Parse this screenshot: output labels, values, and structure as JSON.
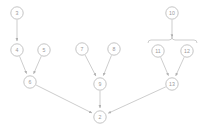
{
  "diagram": {
    "type": "directed-graph",
    "title": "",
    "node_radius": 6.2,
    "colors": {
      "node_stroke": "#bdbdbd",
      "node_fill": "#ffffff",
      "label_text": "#9a9a9a",
      "edge": "#c0c0c0",
      "brace": "#c4c4c4",
      "background": "#ffffff"
    },
    "nodes": [
      {
        "id": "n3",
        "label": "3",
        "x": 17,
        "y": 13
      },
      {
        "id": "n4",
        "label": "4",
        "x": 17,
        "y": 50
      },
      {
        "id": "n5",
        "label": "5",
        "x": 44,
        "y": 50
      },
      {
        "id": "n6",
        "label": "6",
        "x": 30,
        "y": 82
      },
      {
        "id": "n7",
        "label": "7",
        "x": 82,
        "y": 49
      },
      {
        "id": "n8",
        "label": "8",
        "x": 114,
        "y": 49
      },
      {
        "id": "n9",
        "label": "9",
        "x": 100,
        "y": 84
      },
      {
        "id": "n10",
        "label": "10",
        "x": 172,
        "y": 13
      },
      {
        "id": "n11",
        "label": "11",
        "x": 158,
        "y": 51
      },
      {
        "id": "n12",
        "label": "12",
        "x": 187,
        "y": 51
      },
      {
        "id": "n13",
        "label": "13",
        "x": 172,
        "y": 84
      },
      {
        "id": "n2",
        "label": "2",
        "x": 100,
        "y": 117
      }
    ],
    "edges": [
      {
        "id": "e1",
        "from": "n3",
        "to": "n4",
        "arrow": true
      },
      {
        "id": "e2",
        "from": "n4",
        "to": "n6",
        "arrow": true
      },
      {
        "id": "e3",
        "from": "n5",
        "to": "n6",
        "arrow": true
      },
      {
        "id": "e4",
        "from": "n7",
        "to": "n9",
        "arrow": true
      },
      {
        "id": "e5",
        "from": "n8",
        "to": "n9",
        "arrow": true
      },
      {
        "id": "e6",
        "from": "n10",
        "to": "brace",
        "arrow": true
      },
      {
        "id": "e7",
        "from": "n11",
        "to": "n13",
        "arrow": true
      },
      {
        "id": "e8",
        "from": "n12",
        "to": "n13",
        "arrow": true
      },
      {
        "id": "e9",
        "from": "n6",
        "to": "n2",
        "arrow": true
      },
      {
        "id": "e10",
        "from": "n9",
        "to": "n2",
        "arrow": true
      },
      {
        "id": "e11",
        "from": "n13",
        "to": "n2",
        "arrow": true
      }
    ],
    "brace": {
      "id": "group-brace",
      "label": "",
      "left_x": 148,
      "right_x": 197,
      "center_x": 172,
      "y": 40
    }
  }
}
